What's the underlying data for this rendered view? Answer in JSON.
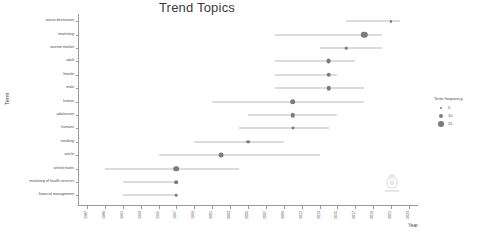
{
  "chart_data": {
    "type": "scatter",
    "title": "Trend Topics",
    "xlabel": "Year",
    "ylabel": "Term",
    "xlim": [
      1986,
      2024
    ],
    "grid": false,
    "legend": {
      "title": "Term frequency",
      "position": "right",
      "entries": [
        {
          "label": "5",
          "size": 2.6
        },
        {
          "label": "10",
          "size": 4.2
        },
        {
          "label": "15",
          "size": 5.6
        }
      ]
    },
    "xticks": [
      "1987",
      "1989",
      "1991",
      "1993",
      "1995",
      "1997",
      "1999",
      "2001",
      "2003",
      "2005",
      "2007",
      "2009",
      "2011",
      "2013",
      "2015",
      "2017",
      "2019",
      "2021",
      "2023"
    ],
    "categories": [
      "tourist destination",
      "marketing",
      "tourism market",
      "adult",
      "female",
      "male",
      "human",
      "adolescent",
      "humans",
      "smoking",
      "article",
      "united states",
      "marketing of health services",
      "financial management"
    ],
    "points": [
      {
        "term": "tourist destination",
        "q1": 2016,
        "median": 2021,
        "q3": 2022,
        "freq": 4
      },
      {
        "term": "marketing",
        "q1": 2008,
        "median": 2018,
        "q3": 2020,
        "freq": 15
      },
      {
        "term": "tourism market",
        "q1": 2013,
        "median": 2016,
        "q3": 2020,
        "freq": 5
      },
      {
        "term": "adult",
        "q1": 2008,
        "median": 2014,
        "q3": 2017,
        "freq": 11
      },
      {
        "term": "female",
        "q1": 2008,
        "median": 2014,
        "q3": 2015,
        "freq": 10
      },
      {
        "term": "male",
        "q1": 2008,
        "median": 2014,
        "q3": 2018,
        "freq": 10
      },
      {
        "term": "human",
        "q1": 2001,
        "median": 2010,
        "q3": 2018,
        "freq": 13
      },
      {
        "term": "adolescent",
        "q1": 2005,
        "median": 2010,
        "q3": 2015,
        "freq": 10
      },
      {
        "term": "humans",
        "q1": 2004,
        "median": 2010,
        "q3": 2014,
        "freq": 6
      },
      {
        "term": "smoking",
        "q1": 1999,
        "median": 2005,
        "q3": 2009,
        "freq": 8
      },
      {
        "term": "article",
        "q1": 1995,
        "median": 2002,
        "q3": 2013,
        "freq": 11
      },
      {
        "term": "united states",
        "q1": 1989,
        "median": 1997,
        "q3": 2004,
        "freq": 13
      },
      {
        "term": "marketing of health services",
        "q1": 1991,
        "median": 1997,
        "q3": 1997,
        "freq": 8
      },
      {
        "term": "financial management",
        "q1": 1991,
        "median": 1997,
        "q3": 1997,
        "freq": 5
      }
    ]
  },
  "watermark": {
    "name": "faint-circular-logo"
  }
}
